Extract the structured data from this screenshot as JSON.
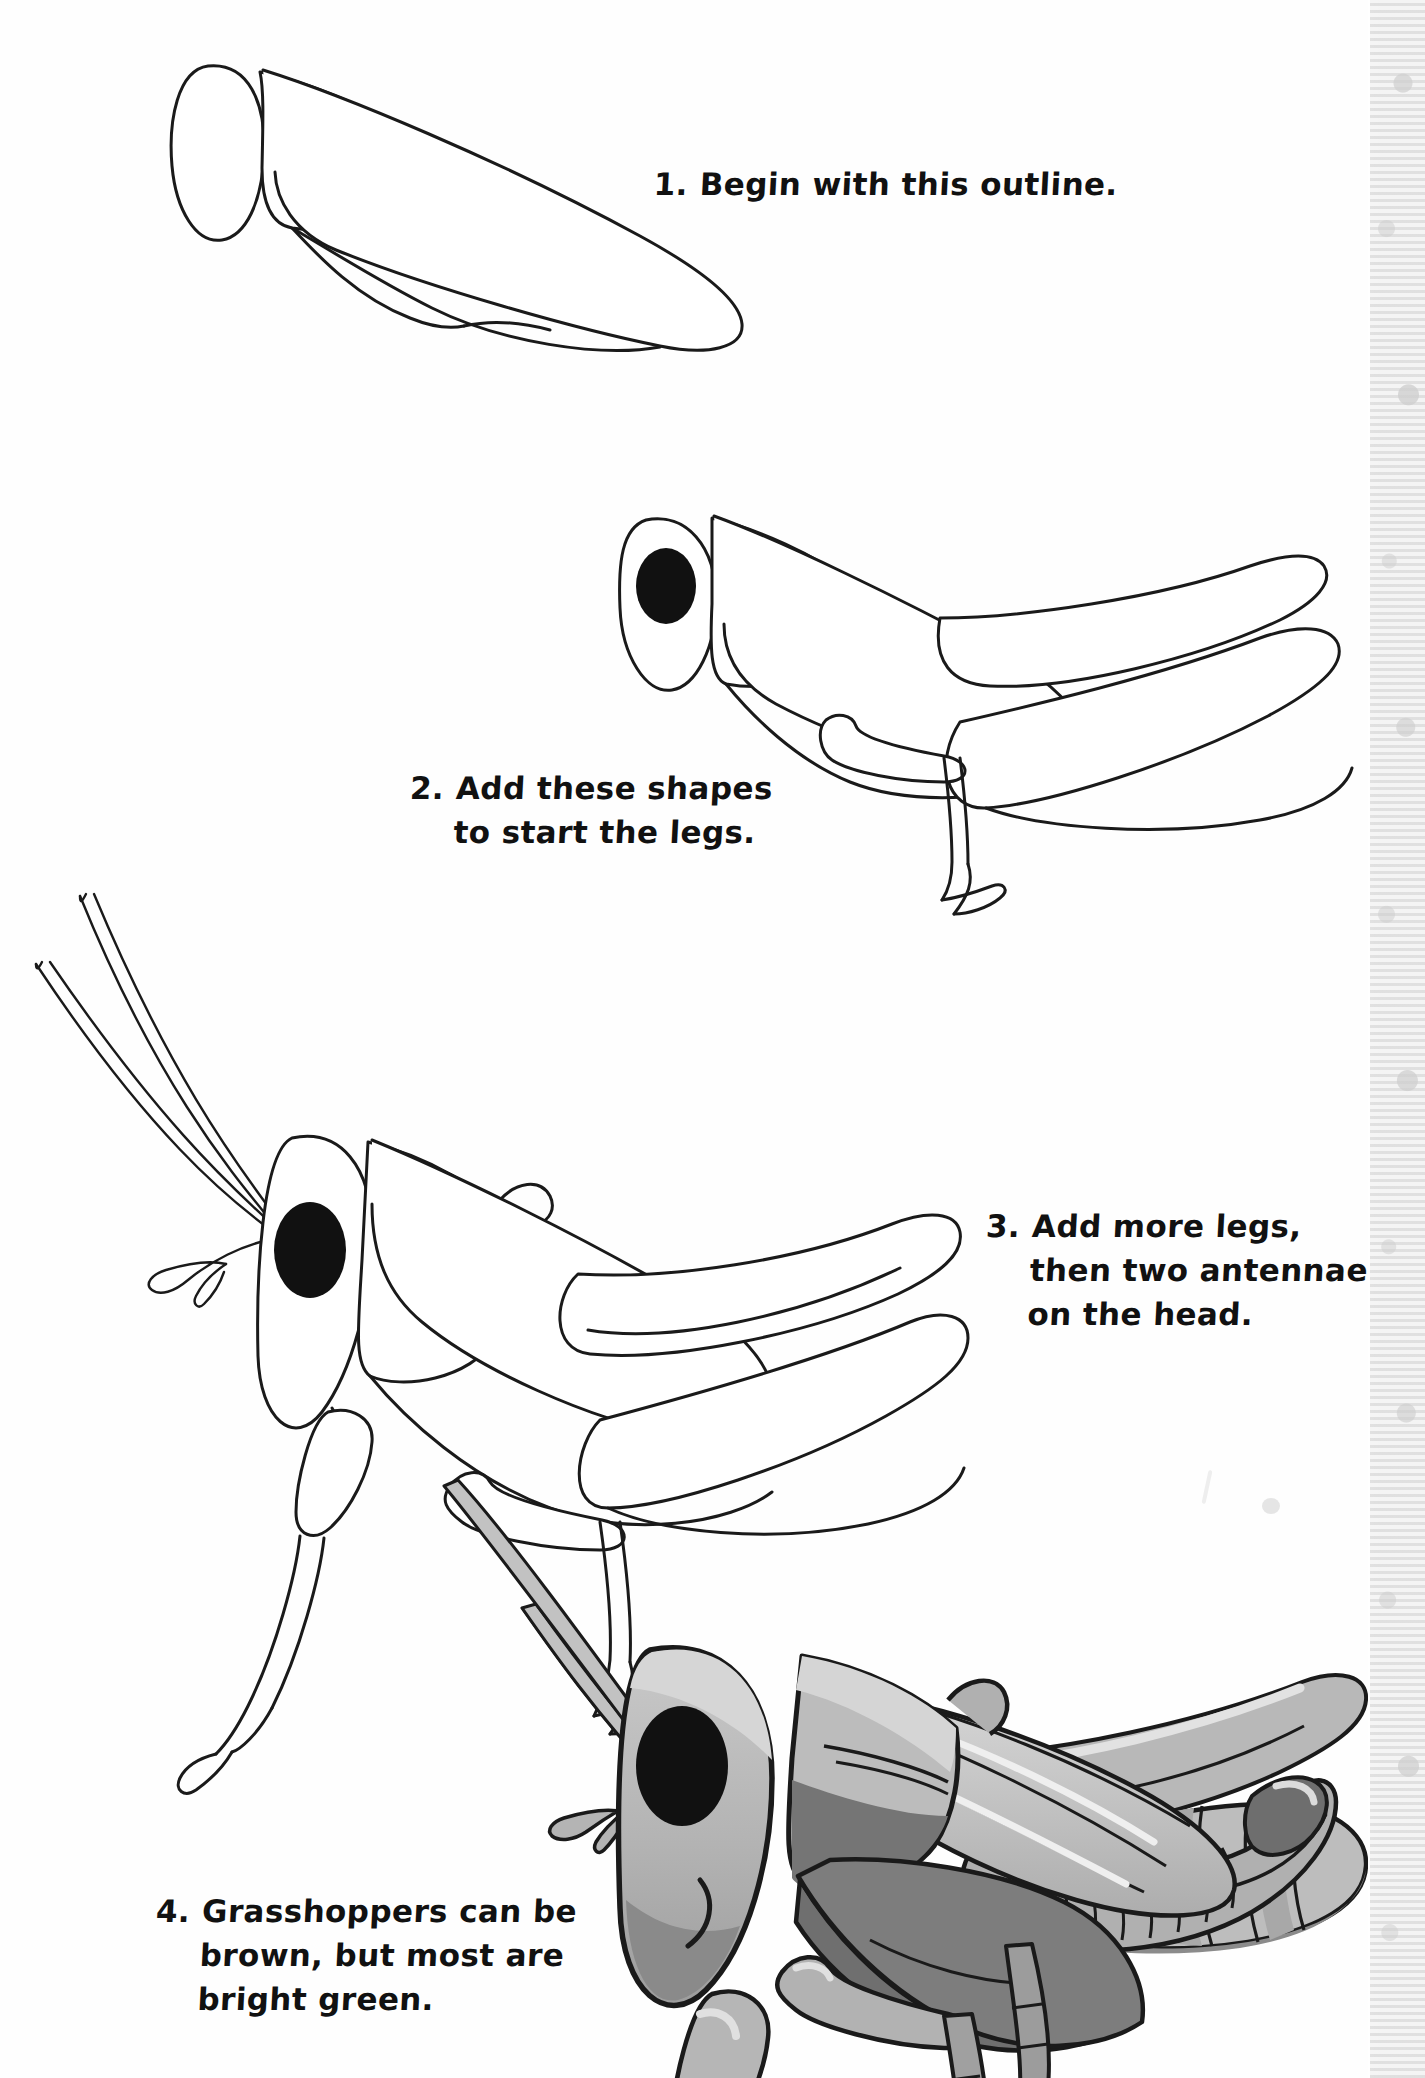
{
  "page": {
    "subject": "grasshopper",
    "background_color": "#ffffff",
    "ink_color": "#1a1a1a"
  },
  "steps": [
    {
      "number": "1.",
      "text": "Begin with this outline.",
      "figure_name": "grasshopper-outline-step-1",
      "figure_description": "Basic body outline: oval head, rounded thorax plate, long tapering abdomen."
    },
    {
      "number": "2.",
      "text": "Add these shapes\nto start the legs.",
      "figure_name": "grasshopper-outline-step-2",
      "figure_description": "Outline with black eye added plus large hind leg femur, tibia and a foreleg."
    },
    {
      "number": "3.",
      "text": "Add more legs,\nthen two antennae\non the head.",
      "figure_name": "grasshopper-outline-step-3",
      "figure_description": "Full line drawing with two antennae, middle and front legs, and jointed feet."
    },
    {
      "number": "4.",
      "text": "Grasshoppers can be\nbrown, but most are\nbright green.",
      "figure_name": "grasshopper-finished-colored",
      "figure_description": "Finished shaded grasshopper with wing veins, striped abdomen, smiling mouth."
    }
  ],
  "palette": {
    "ink": "#1a1a1a",
    "paper": "#ffffff",
    "shade_light": "#d9d9d9",
    "shade_mid": "#b5b5b5",
    "shade_base": "#9a9a9a",
    "shade_dark": "#7d7d7d",
    "shade_darkest": "#636363",
    "eye_black": "#111111",
    "edge_strip": "#f4f4f4"
  },
  "decor": {
    "edge_strip_name": "page-edge-pattern-strip"
  }
}
